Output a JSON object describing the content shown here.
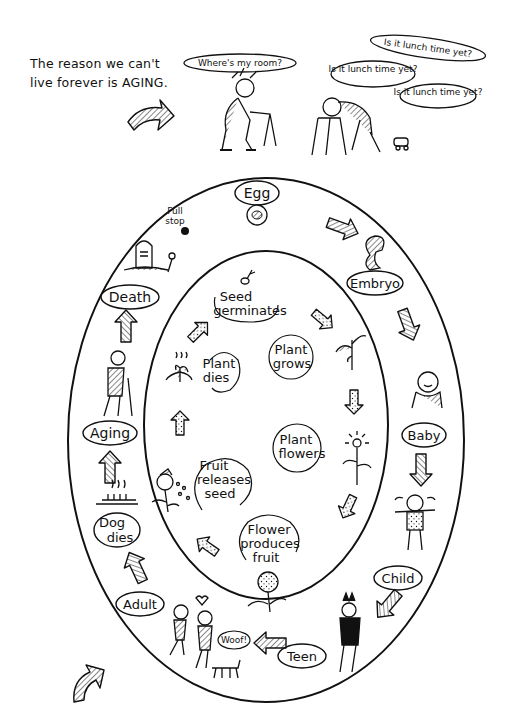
{
  "intro": {
    "line1": "The reason we can't",
    "line2": "live forever is AGING."
  },
  "top_scene": {
    "speech_left": "Where's my room?",
    "speech_right_1": "Is it lunch time yet?",
    "speech_right_2": "Is it lunch time yet?",
    "speech_right_3": "Is it lunch time yet?"
  },
  "human_cycle": {
    "stages": [
      {
        "label": "Egg"
      },
      {
        "label": "Embryo"
      },
      {
        "label": "Baby"
      },
      {
        "label": "Child"
      },
      {
        "label": "Teen"
      },
      {
        "label": "Adult"
      },
      {
        "label": "Dog dies"
      },
      {
        "label": "Aging"
      },
      {
        "label": "Death"
      }
    ],
    "full_stop_note": "Full stop",
    "woof": "Woof!"
  },
  "plant_cycle": {
    "stages": [
      {
        "label_1": "Seed",
        "label_2": "germinates"
      },
      {
        "label_1": "Plant",
        "label_2": "grows"
      },
      {
        "label_1": "Plant",
        "label_2": "flowers"
      },
      {
        "label_1": "Flower",
        "label_2": "produces",
        "label_3": "fruit"
      },
      {
        "label_1": "Fruit",
        "label_2": "releases",
        "label_3": "seed"
      },
      {
        "label_1": "Plant",
        "label_2": "dies"
      }
    ]
  },
  "colors": {
    "ink": "#111111",
    "paper": "#ffffff"
  }
}
